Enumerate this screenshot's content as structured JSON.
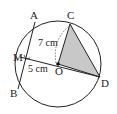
{
  "diagram": {
    "type": "circle-geometry",
    "points": {
      "A": {
        "label": "A",
        "x": 35,
        "y": 22
      },
      "B": {
        "label": "B",
        "x": 18,
        "y": 89
      },
      "C": {
        "label": "C",
        "x": 70,
        "y": 24
      },
      "D": {
        "label": "D",
        "x": 100,
        "y": 77
      },
      "M": {
        "label": "M",
        "x": 20,
        "y": 57
      },
      "O": {
        "label": "O",
        "x": 58,
        "y": 64
      }
    },
    "circle": {
      "cx": 58,
      "cy": 64,
      "r": 43
    },
    "measurements": {
      "OC": "7 cm",
      "OM": "5 cm"
    },
    "shaded_triangle": [
      "O",
      "C",
      "D"
    ],
    "colors": {
      "stroke": "#222222",
      "shade": "#c8c8c8",
      "dashed": "#555555"
    }
  }
}
